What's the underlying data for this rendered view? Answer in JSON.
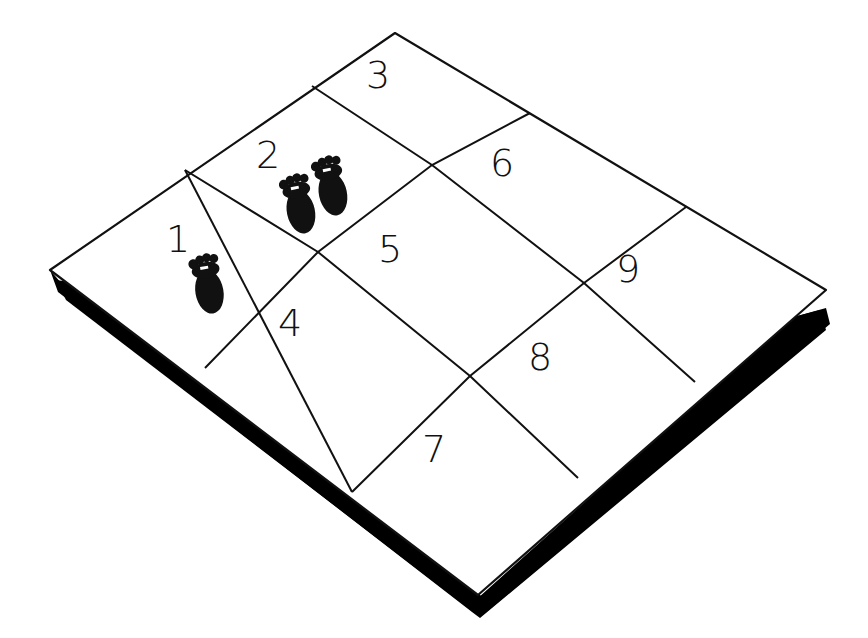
{
  "illustration": {
    "title": "Numbered 3x3 grid mat with footprints",
    "colors": {
      "background": "#ffffff",
      "line": "#111111",
      "shadow": "#000000",
      "footprint": "#111111"
    },
    "mat": {
      "corners": {
        "left": [
          50,
          270
        ],
        "top": [
          395,
          33
        ],
        "right": [
          826,
          290
        ],
        "bottom": [
          478,
          595
        ]
      }
    },
    "squares": [
      {
        "label": "1",
        "x": 176,
        "y": 250
      },
      {
        "label": "2",
        "x": 268,
        "y": 170
      },
      {
        "label": "3",
        "x": 378,
        "y": 88
      },
      {
        "label": "4",
        "x": 290,
        "y": 336
      },
      {
        "label": "5",
        "x": 390,
        "y": 262
      },
      {
        "label": "6",
        "x": 506,
        "y": 176
      },
      {
        "label": "7",
        "x": 434,
        "y": 470
      },
      {
        "label": "8",
        "x": 540,
        "y": 372
      },
      {
        "label": "9",
        "x": 628,
        "y": 282
      }
    ],
    "footprints": [
      {
        "square": "1",
        "x": 205,
        "y": 275,
        "rotate": -10
      },
      {
        "square": "2",
        "x": 297,
        "y": 195,
        "rotate": -12
      },
      {
        "square": "2",
        "x": 330,
        "y": 180,
        "rotate": -12
      }
    ]
  }
}
